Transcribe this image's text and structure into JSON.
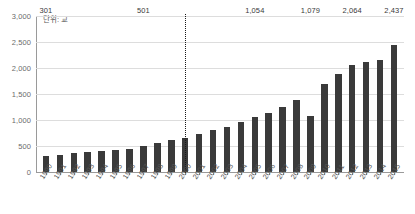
{
  "chart_data": {
    "type": "bar",
    "title": "",
    "subtitle": "",
    "unit_label": "단위: 교",
    "xlabel": "",
    "ylabel": "",
    "ylim": [
      0,
      3000
    ],
    "ytick_labels": [
      "3,000",
      "2,500",
      "2,000",
      "1,500",
      "1,000",
      "500",
      "0"
    ],
    "ytick_values": [
      3000,
      2500,
      2000,
      1500,
      1000,
      500,
      0
    ],
    "grid": true,
    "legend": null,
    "bar_color": "#3a3a3a",
    "categories": [
      "1990",
      "1991",
      "1992",
      "1993",
      "1994",
      "1995",
      "1996",
      "1997",
      "1998",
      "1999",
      "2000",
      "2001",
      "2002",
      "2003",
      "2004",
      "2005",
      "2006",
      "2007",
      "2008",
      "2009",
      "2010",
      "2011",
      "2012",
      "2013",
      "2014",
      "2015"
    ],
    "values": [
      301,
      330,
      360,
      382,
      405,
      428,
      450,
      501,
      557,
      625,
      650,
      735,
      805,
      872,
      962,
      1054,
      1140,
      1253,
      1390,
      1079,
      1688,
      1882,
      2064,
      2112,
      2160,
      2437
    ],
    "point_labels": [
      {
        "category": "1990",
        "value": 301,
        "text": "301"
      },
      {
        "category": "1997",
        "value": 501,
        "text": "501"
      },
      {
        "category": "2005",
        "value": 1054,
        "text": "1,054"
      },
      {
        "category": "2009",
        "value": 1079,
        "text": "1,079"
      },
      {
        "category": "2012",
        "value": 2064,
        "text": "2,064"
      },
      {
        "category": "2015",
        "value": 2437,
        "text": "2,437"
      }
    ],
    "annotations": [
      {
        "type": "vertical-dotted-line",
        "at_category": "2000"
      }
    ]
  }
}
